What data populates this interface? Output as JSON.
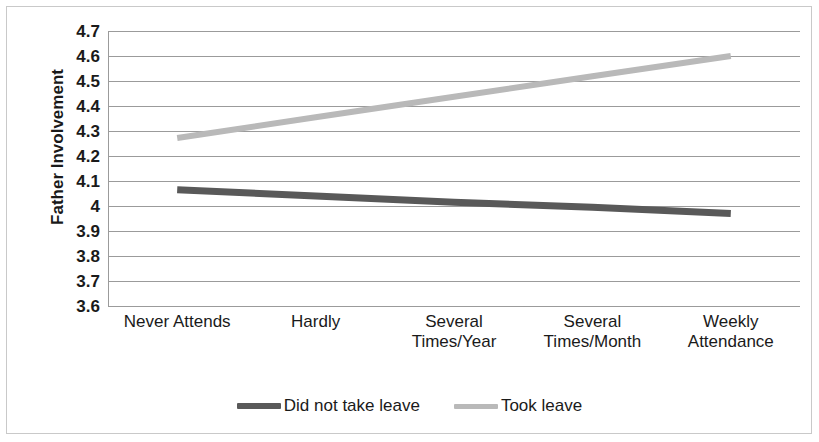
{
  "chart_data": {
    "type": "line",
    "title": "",
    "xlabel": "",
    "ylabel": "Father Involvement",
    "ylim": [
      3.6,
      4.7
    ],
    "ytick_step": 0.1,
    "grid": true,
    "legend_position": "bottom-center",
    "categories": [
      "Never Attends",
      "Hardly",
      "Several Times/Year",
      "Several Times/Month",
      "Weekly Attendance"
    ],
    "category_lines": [
      [
        "Never Attends"
      ],
      [
        "Hardly"
      ],
      [
        "Several",
        "Times/Year"
      ],
      [
        "Several",
        "Times/Month"
      ],
      [
        "Weekly",
        "Attendance"
      ]
    ],
    "ytick_labels": [
      "4.7",
      "4.6",
      "4.5",
      "4.4",
      "4.3",
      "4.2",
      "4.1",
      "4",
      "3.9",
      "3.8",
      "3.7",
      "3.6"
    ],
    "ytick_values": [
      4.7,
      4.6,
      4.5,
      4.4,
      4.3,
      4.2,
      4.1,
      4.0,
      3.9,
      3.8,
      3.7,
      3.6
    ],
    "series": [
      {
        "name": "Did not take leave",
        "color": "#595959",
        "width": 7,
        "values": [
          4.065,
          4.04,
          4.015,
          3.995,
          3.97
        ]
      },
      {
        "name": "Took leave",
        "color": "#b9b9b9",
        "width": 6,
        "values": [
          4.272,
          4.355,
          4.437,
          4.519,
          4.6
        ]
      }
    ],
    "colors": {
      "series_dark": "#595959",
      "series_light": "#b9b9b9",
      "gridline": "#9b9b9b",
      "axis": "#9b9b9b",
      "frame": "#c9c9c9",
      "text": "#1a1a1a",
      "background": "#ffffff"
    }
  },
  "legend": {
    "entries": [
      {
        "label": "Did not take leave"
      },
      {
        "label": "Took leave"
      }
    ]
  }
}
